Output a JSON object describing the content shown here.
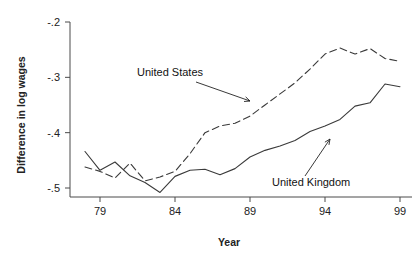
{
  "chart_data": {
    "type": "line",
    "title": "",
    "xlabel": "Year",
    "ylabel": "Difference in log wages",
    "xlim": [
      78,
      100
    ],
    "ylim": [
      -0.52,
      -0.19
    ],
    "xticks": [
      79,
      84,
      89,
      94,
      99
    ],
    "xticklabels": [
      "79",
      "84",
      "89",
      "94",
      "99"
    ],
    "yticks": [
      -0.2,
      -0.3,
      -0.4,
      -0.5
    ],
    "yticklabels": [
      "-.2",
      "-.3",
      "-.4",
      "-.5"
    ],
    "grid": false,
    "legend_position": "inline-annotations",
    "series": [
      {
        "name": "United States",
        "style": "dashed",
        "color": "#3a3a3a",
        "x": [
          78,
          79,
          80,
          81,
          82,
          83,
          84,
          85,
          86,
          87,
          88,
          89,
          90,
          91,
          92,
          93,
          94,
          95,
          96,
          97,
          98,
          99
        ],
        "values": [
          -0.462,
          -0.47,
          -0.482,
          -0.455,
          -0.487,
          -0.48,
          -0.47,
          -0.438,
          -0.4,
          -0.388,
          -0.383,
          -0.37,
          -0.35,
          -0.33,
          -0.31,
          -0.285,
          -0.258,
          -0.247,
          -0.258,
          -0.248,
          -0.266,
          -0.271
        ]
      },
      {
        "name": "United Kingdom",
        "style": "solid",
        "color": "#3a3a3a",
        "x": [
          78,
          79,
          80,
          81,
          82,
          83,
          84,
          85,
          86,
          87,
          88,
          89,
          90,
          91,
          92,
          93,
          94,
          95,
          96,
          97,
          98,
          99
        ],
        "values": [
          -0.434,
          -0.468,
          -0.453,
          -0.478,
          -0.49,
          -0.508,
          -0.479,
          -0.468,
          -0.466,
          -0.476,
          -0.465,
          -0.444,
          -0.432,
          -0.424,
          -0.414,
          -0.398,
          -0.388,
          -0.376,
          -0.352,
          -0.346,
          -0.312,
          -0.317
        ]
      }
    ],
    "annotations": [
      {
        "label": "United States",
        "text_x": 137,
        "text_y": 76,
        "arrow_from_x": 196,
        "arrow_from_y": 82,
        "arrow_to_x": 250,
        "arrow_to_y": 101
      },
      {
        "label": "United Kingdom",
        "text_x": 272,
        "text_y": 186,
        "arrow_from_x": 305,
        "arrow_from_y": 176,
        "arrow_to_x": 330,
        "arrow_to_y": 139
      }
    ]
  }
}
